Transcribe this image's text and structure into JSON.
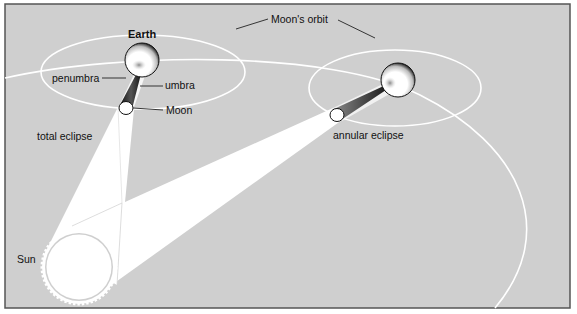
{
  "diagram": {
    "colors": {
      "background": "#cfcfcf",
      "frame": "#555555",
      "light": "#ffffff",
      "shadow": "#2a2a2a",
      "text": "#111111"
    },
    "labels": {
      "earth": "Earth",
      "moons_orbit": "Moon's orbit",
      "penumbra": "penumbra",
      "umbra": "umbra",
      "moon": "Moon",
      "total_eclipse": "total eclipse",
      "annular_eclipse": "annular eclipse",
      "sun": "Sun"
    },
    "scenes": [
      {
        "name": "total eclipse",
        "earth": {
          "cx": 142,
          "cy": 60,
          "r": 17
        },
        "moon": {
          "cx": 126,
          "cy": 108,
          "r": 7
        },
        "orbit": {
          "cx": 143,
          "cy": 72,
          "rx": 102,
          "ry": 37
        }
      },
      {
        "name": "annular eclipse",
        "earth": {
          "cx": 398,
          "cy": 80,
          "r": 17
        },
        "moon": {
          "cx": 337,
          "cy": 115,
          "r": 7
        },
        "orbit": {
          "cx": 395,
          "cy": 88,
          "rx": 86,
          "ry": 38
        }
      }
    ],
    "sun": {
      "cx": 79,
      "cy": 267,
      "r": 33
    }
  }
}
